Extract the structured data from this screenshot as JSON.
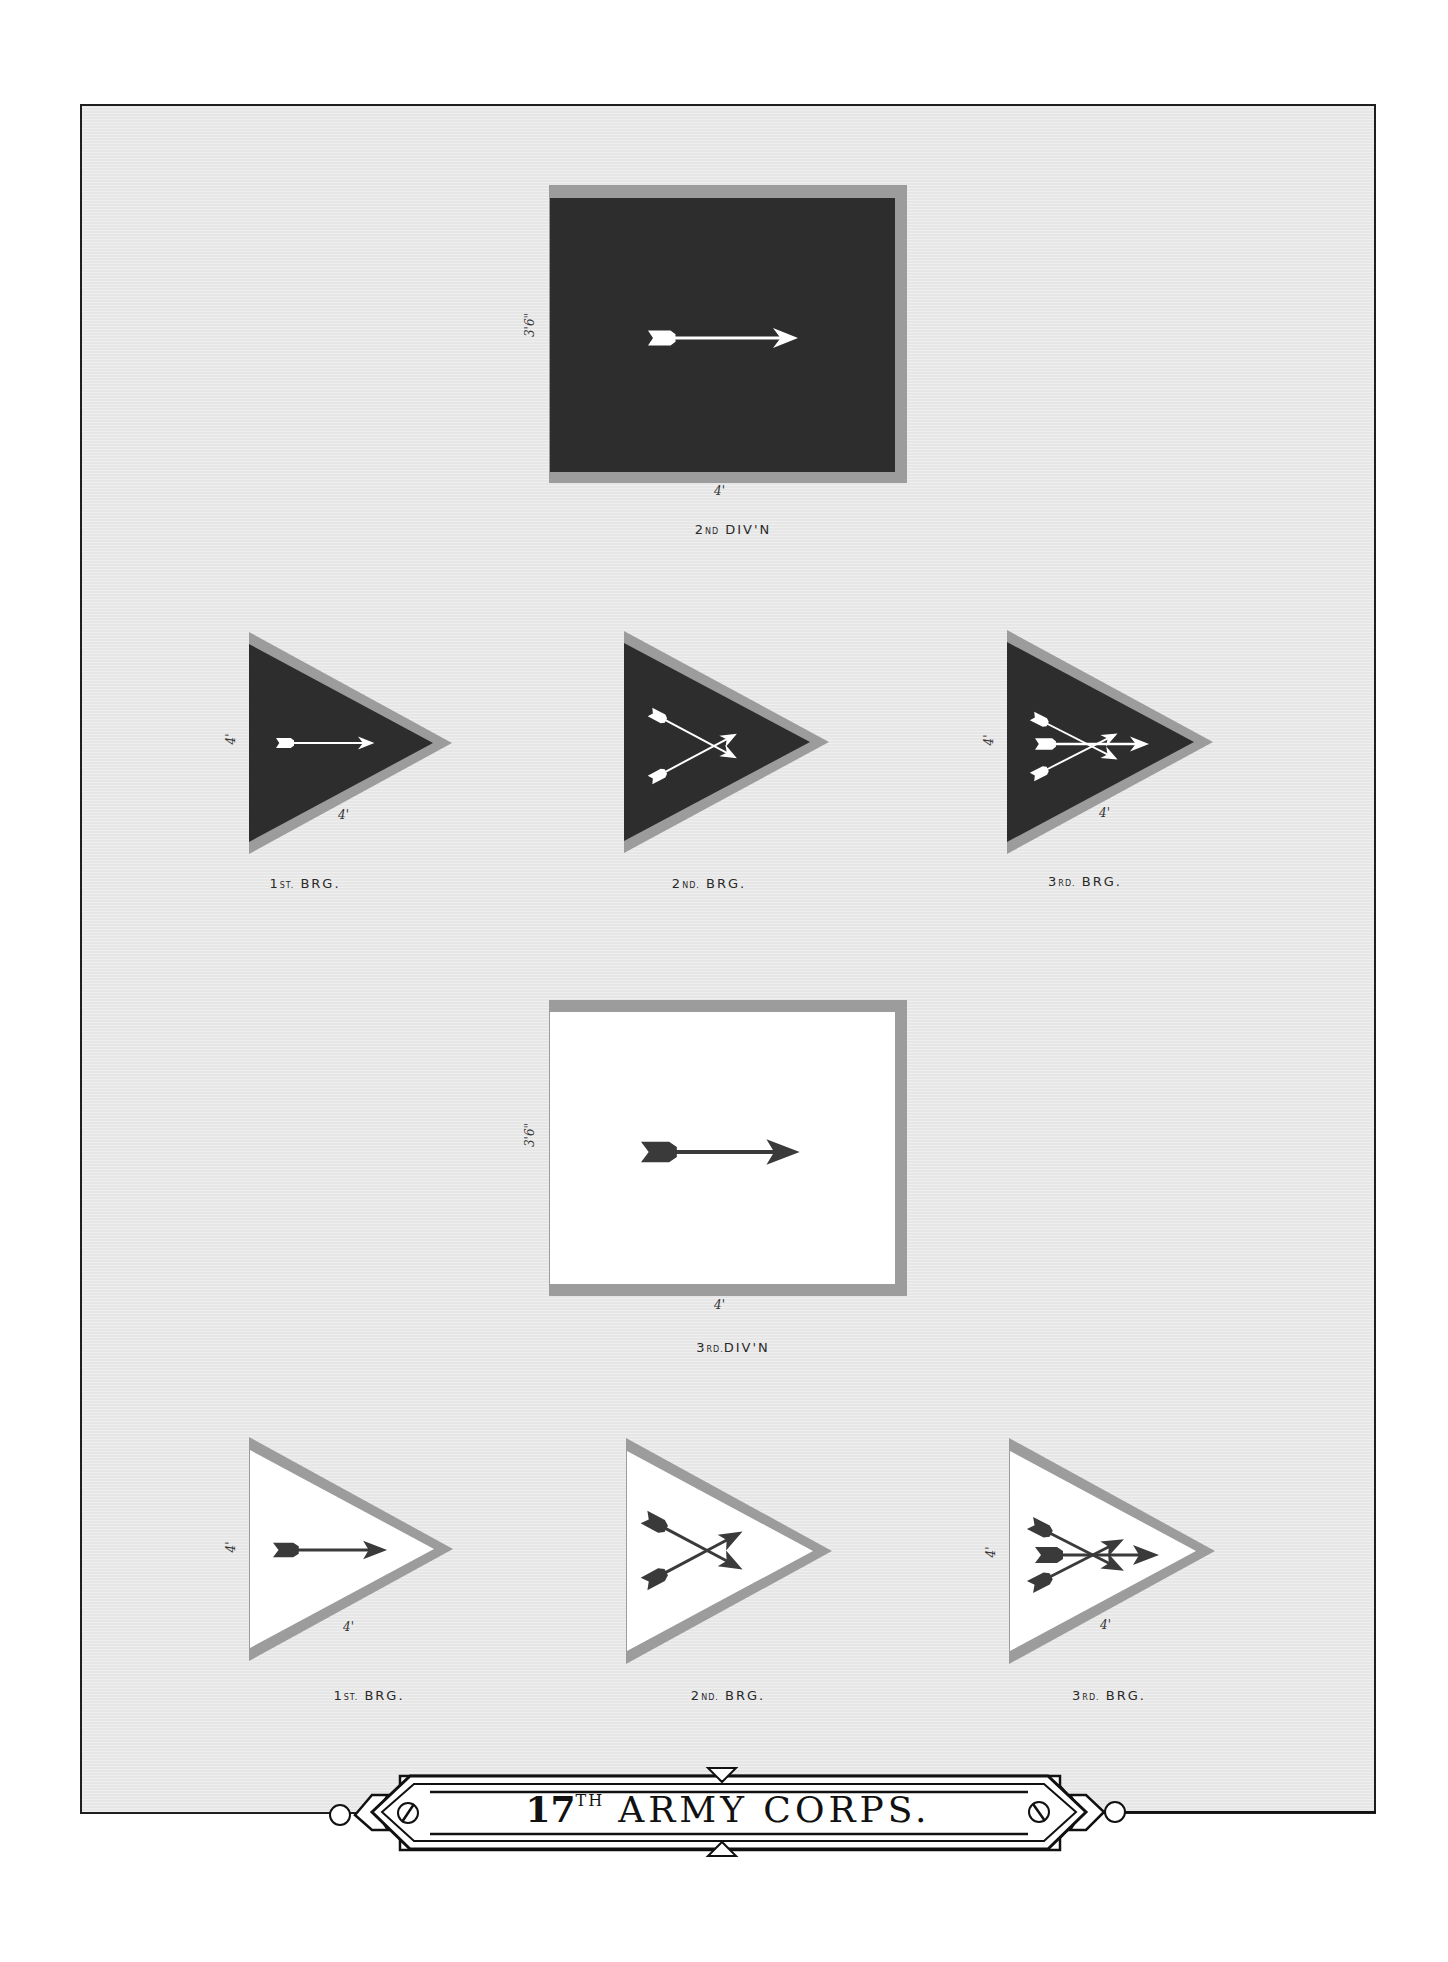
{
  "plate": {
    "title_number": "17",
    "title_suffix": "TH",
    "title_text": "ARMY CORPS.",
    "colors": {
      "background": "#e6e6e6",
      "frame": "#1e1e1e",
      "flag_dark": "#2d2d2d",
      "flag_light": "#ffffff",
      "flag_border": "#9c9c9c",
      "arrow_dark": "#3a3a3a",
      "arrow_light": "#ffffff"
    }
  },
  "flags": [
    {
      "id": "div2",
      "shape": "rectangle",
      "field": "dark",
      "arrows": 1,
      "label_main": "2",
      "label_sup": "ND",
      "label_rest": " DIV'N",
      "height_dim": "3'6\"",
      "width_dim": "4'"
    },
    {
      "id": "div2-brg1",
      "shape": "triangle",
      "field": "dark",
      "arrows": 1,
      "label_main": "1",
      "label_sup": "ST.",
      "label_rest": " BRG.",
      "height_dim": "4'",
      "width_dim": "4'"
    },
    {
      "id": "div2-brg2",
      "shape": "triangle",
      "field": "dark",
      "arrows": 2,
      "label_main": "2",
      "label_sup": "ND.",
      "label_rest": " BRG."
    },
    {
      "id": "div2-brg3",
      "shape": "triangle",
      "field": "dark",
      "arrows": 3,
      "label_main": "3",
      "label_sup": "RD.",
      "label_rest": " BRG.",
      "height_dim": "4'",
      "width_dim": "4'"
    },
    {
      "id": "div3",
      "shape": "rectangle",
      "field": "light",
      "arrows": 1,
      "label_main": "3",
      "label_sup": "RD.",
      "label_rest": "DIV'N",
      "height_dim": "3'6\"",
      "width_dim": "4'"
    },
    {
      "id": "div3-brg1",
      "shape": "triangle",
      "field": "light",
      "arrows": 1,
      "label_main": "1",
      "label_sup": "ST.",
      "label_rest": " BRG.",
      "height_dim": "4'",
      "width_dim": "4'"
    },
    {
      "id": "div3-brg2",
      "shape": "triangle",
      "field": "light",
      "arrows": 2,
      "label_main": "2",
      "label_sup": "ND.",
      "label_rest": " BRG."
    },
    {
      "id": "div3-brg3",
      "shape": "triangle",
      "field": "light",
      "arrows": 3,
      "label_main": "3",
      "label_sup": "RD.",
      "label_rest": " BRG.",
      "height_dim": "4'",
      "width_dim": "4'"
    }
  ]
}
